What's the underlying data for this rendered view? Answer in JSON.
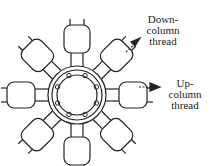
{
  "diagram": {
    "center": {
      "x": 77,
      "y": 95
    },
    "tube_count": 8,
    "labels": {
      "down": [
        "Down-",
        "column",
        "thread"
      ],
      "up": [
        "Up-",
        "column",
        "thread"
      ]
    },
    "colors": {
      "stroke": "#222222",
      "background": "#ffffff"
    }
  }
}
